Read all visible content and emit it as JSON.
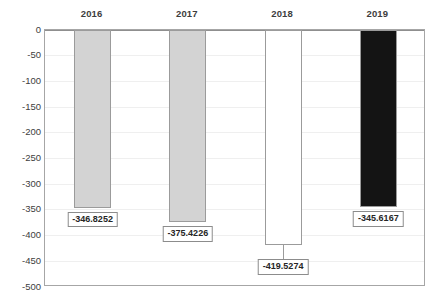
{
  "chart_data": {
    "type": "bar",
    "title": "",
    "subtitle": "",
    "xlabel": "",
    "ylabel": "",
    "categories": [
      "2016",
      "2017",
      "2018",
      "2019"
    ],
    "values": [
      -346.8252,
      -375.4226,
      -419.5274,
      -345.6167
    ],
    "data_labels": [
      "-346.8252",
      "-375.4226",
      "-419.5274",
      "-345.6167"
    ],
    "ylim": [
      -500,
      0
    ],
    "ytick_labels": [
      "0",
      "-50",
      "-100",
      "-150",
      "-200",
      "-250",
      "-300",
      "-350",
      "-400",
      "-450",
      "-500"
    ],
    "ytick_values": [
      0,
      -50,
      -100,
      -150,
      -200,
      -250,
      -300,
      -350,
      -400,
      -450,
      -500
    ],
    "ytick_step": 50,
    "grid": true,
    "grid_axis": "y",
    "legend": false,
    "legend_position": "none",
    "category_labels_position": "top",
    "bar_colors": [
      "#d3d3d3",
      "#d3d3d3",
      "#ffffff",
      "#141414"
    ],
    "bar_border_color": "#9b9b9b",
    "gridline_color": "#efefef",
    "axis_color": "#a6a6a6",
    "plot_background": "#ffffff",
    "text_color": "#3d3d3d",
    "data_label_border_color": "#8c8c8c",
    "data_label_background": "#ffffff"
  }
}
